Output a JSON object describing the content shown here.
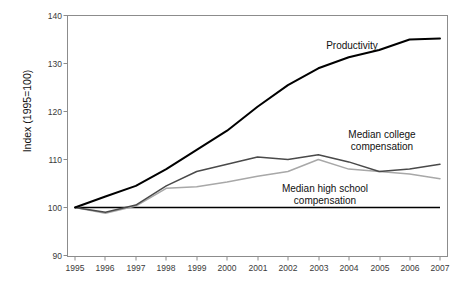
{
  "chart_data": {
    "type": "line",
    "title": "",
    "xlabel": "",
    "ylabel": "Index (1995=100)",
    "x": [
      1995,
      1996,
      1997,
      1998,
      1999,
      2000,
      2001,
      2002,
      2003,
      2004,
      2005,
      2006,
      2007
    ],
    "xticklabels": [
      "1995",
      "1996",
      "1997",
      "1998",
      "1999",
      "2000",
      "2001",
      "2002",
      "2003",
      "2004",
      "2005",
      "2006",
      "2007"
    ],
    "yticklabels": [
      "90",
      "100",
      "110",
      "120",
      "130",
      "140"
    ],
    "yticks": [
      90,
      100,
      110,
      120,
      130,
      140
    ],
    "ylim": [
      90,
      140
    ],
    "xlim": [
      1995,
      2007
    ],
    "grid": false,
    "legend": "inline-annotations",
    "reference_line": {
      "value": 100,
      "label": "index baseline",
      "color": "#000000"
    },
    "series": [
      {
        "name": "Productivity",
        "color": "#000000",
        "width": 2.0,
        "values": [
          100,
          102.3,
          104.5,
          108.0,
          112.0,
          116.0,
          121.0,
          125.5,
          129.0,
          131.3,
          132.8,
          135.0,
          135.2
        ]
      },
      {
        "name": "Median college compensation",
        "color": "#4a4a4a",
        "width": 1.5,
        "values": [
          100,
          99.0,
          100.5,
          104.5,
          107.5,
          109.0,
          110.5,
          110.0,
          111.0,
          109.5,
          107.5,
          108.0,
          109.0
        ]
      },
      {
        "name": "Median high school compensation",
        "color": "#a8a8a8",
        "width": 1.5,
        "values": [
          100,
          98.8,
          100.3,
          104.0,
          104.3,
          105.3,
          106.5,
          107.5,
          110.0,
          108.0,
          107.5,
          107.0,
          106.0
        ]
      }
    ],
    "annotations": [
      {
        "id": "productivity",
        "text": "Productivity",
        "lines": [
          "Productivity"
        ],
        "x_px": 352,
        "y_px": 46
      },
      {
        "id": "median-college",
        "text": "Median college compensation",
        "lines": [
          "Median college",
          "compensation"
        ],
        "x_px": 382,
        "y_px": 136
      },
      {
        "id": "median-high-school",
        "text": "Median high school compensation",
        "lines": [
          "Median high school",
          "compensation"
        ],
        "x_px": 325,
        "y_px": 190
      }
    ]
  },
  "axis": {
    "y_title": "Index (1995=100)",
    "yticks": [
      "140",
      "130",
      "120",
      "110",
      "100",
      "90"
    ],
    "xticks": [
      "1995",
      "1996",
      "1997",
      "1998",
      "1999",
      "2000",
      "2001",
      "2002",
      "2003",
      "2004",
      "2005",
      "2006",
      "2007"
    ]
  },
  "annotations": {
    "productivity": "Productivity",
    "college_l1": "Median college",
    "college_l2": "compensation",
    "highschool_l1": "Median high school",
    "highschool_l2": "compensation"
  }
}
